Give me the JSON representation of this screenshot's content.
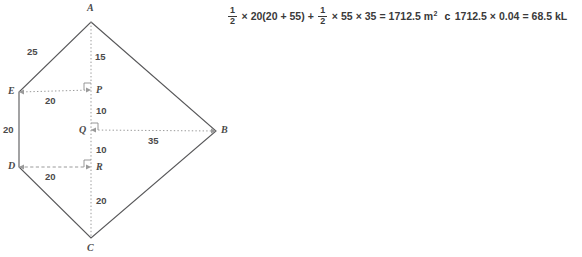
{
  "figure": {
    "stroke_color": "#58585a",
    "guide_color": "#8c8c8c",
    "vertices": [
      {
        "id": "A",
        "label": "A",
        "x": 91,
        "y": 22,
        "label_x": 87,
        "label_y": 3
      },
      {
        "id": "B",
        "label": "B",
        "x": 216,
        "y": 131,
        "label_x": 221,
        "label_y": 125
      },
      {
        "id": "C",
        "label": "C",
        "x": 91,
        "y": 238,
        "label_x": 87,
        "label_y": 243
      },
      {
        "id": "D",
        "label": "D",
        "x": 19,
        "y": 167,
        "label_x": 8,
        "label_y": 161
      },
      {
        "id": "E",
        "label": "E",
        "x": 19,
        "y": 92,
        "label_x": 8,
        "label_y": 86
      }
    ],
    "interior_points": [
      {
        "id": "P",
        "label": "P",
        "x": 91,
        "y": 90,
        "label_x": 96,
        "label_y": 85
      },
      {
        "id": "Q",
        "label": "Q",
        "x": 91,
        "y": 130,
        "label_x": 79,
        "label_y": 125
      },
      {
        "id": "R",
        "label": "R",
        "x": 91,
        "y": 167,
        "label_x": 96,
        "label_y": 162
      }
    ],
    "measures": [
      {
        "id": "AE",
        "value": "25",
        "x": 27,
        "y": 47
      },
      {
        "id": "AP",
        "value": "15",
        "x": 95,
        "y": 52
      },
      {
        "id": "EP",
        "value": "20",
        "x": 45,
        "y": 96
      },
      {
        "id": "PQ",
        "value": "10",
        "x": 96,
        "y": 106
      },
      {
        "id": "ED",
        "value": "20",
        "x": 3,
        "y": 125
      },
      {
        "id": "QB",
        "value": "35",
        "x": 148,
        "y": 136
      },
      {
        "id": "QR",
        "value": "10",
        "x": 96,
        "y": 145
      },
      {
        "id": "DR",
        "value": "20",
        "x": 45,
        "y": 172
      },
      {
        "id": "RC",
        "value": "20",
        "x": 96,
        "y": 196
      }
    ],
    "right_angle_markers": [
      {
        "id": "at-P",
        "x": 91,
        "y": 90,
        "dir": "up-left"
      },
      {
        "id": "at-Q",
        "x": 91,
        "y": 130,
        "dir": "up-right"
      },
      {
        "id": "at-R",
        "x": 91,
        "y": 167,
        "dir": "up-left"
      }
    ]
  },
  "working": {
    "part_letter": "c",
    "expr1": {
      "frac1_num": "1",
      "frac1_den": "2",
      "times1": "×",
      "term1": "20(20 + 55)",
      "plus": "+",
      "frac2_num": "1",
      "frac2_den": "2",
      "times2": "×",
      "term2": "55",
      "times3": "×",
      "term3": "35",
      "equals": "=",
      "result": "1712.5 m",
      "result_unit_sup": "2"
    },
    "expr2": {
      "value": "1712.5",
      "times": "×",
      "rate": "0.04",
      "equals": "=",
      "result": "68.5 kL"
    }
  }
}
